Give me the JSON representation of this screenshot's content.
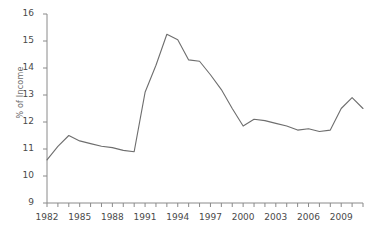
{
  "chart_data": {
    "type": "line",
    "title": "",
    "xlabel": "",
    "ylabel": "% of Income",
    "xlim": [
      1982,
      2011
    ],
    "ylim": [
      9,
      16
    ],
    "ytick_labels": [
      "16",
      "15",
      "14",
      "13",
      "12",
      "11",
      "10",
      "9"
    ],
    "ytick_values": [
      16,
      15,
      14,
      13,
      12,
      11,
      10,
      9
    ],
    "xtick_labels": [
      "1982",
      "1985",
      "1988",
      "1991",
      "1994",
      "1997",
      "2000",
      "2003",
      "2006",
      "2009"
    ],
    "xtick_values": [
      1982,
      1985,
      1988,
      1991,
      1994,
      1997,
      2000,
      2003,
      2006,
      2009
    ],
    "x_minor_ticks": [
      1982,
      1983,
      1984,
      1985,
      1986,
      1987,
      1988,
      1989,
      1990,
      1991,
      1992,
      1993,
      1994,
      1995,
      1996,
      1997,
      1998,
      1999,
      2000,
      2001,
      2002,
      2003,
      2004,
      2005,
      2006,
      2007,
      2008,
      2009,
      2010,
      2011
    ],
    "grid": false,
    "legend": "none",
    "line_color": "#6e6e6e",
    "axis_color": "#8a8a8a",
    "text_color": "#4a4a4a",
    "background": "#ffffff",
    "x": [
      1982,
      1983,
      1984,
      1985,
      1986,
      1987,
      1988,
      1989,
      1990,
      1991,
      1992,
      1993,
      1994,
      1995,
      1996,
      1997,
      1998,
      1999,
      2000,
      2001,
      2002,
      2003,
      2004,
      2005,
      2006,
      2007,
      2008,
      2009,
      2010,
      2011
    ],
    "values": [
      10.6,
      11.1,
      11.5,
      11.3,
      11.2,
      11.1,
      11.05,
      10.95,
      10.9,
      13.1,
      14.1,
      15.25,
      15.05,
      14.3,
      14.25,
      13.75,
      13.2,
      12.5,
      11.85,
      12.1,
      12.05,
      11.95,
      11.85,
      11.7,
      11.75,
      11.65,
      11.7,
      12.5,
      12.9,
      12.5
    ],
    "series_name": "% of Income"
  }
}
